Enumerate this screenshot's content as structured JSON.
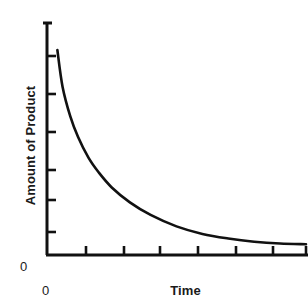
{
  "chart_data": {
    "type": "line",
    "title": "",
    "subtitle": "",
    "xlabel": "Time",
    "ylabel": "Amount of Product",
    "x_origin_label": "0",
    "y_origin_label": "0",
    "grid": false,
    "legend": null,
    "xlim": [
      0,
      10
    ],
    "ylim": [
      0,
      10
    ],
    "x_tick_labels": [],
    "y_tick_labels": [],
    "x_tick_count": 7,
    "y_tick_count": 6,
    "annotations": [],
    "series": [
      {
        "name": "Amount of Product",
        "color": "#111111",
        "x": [
          0.4,
          0.6,
          0.9,
          1.2,
          1.6,
          2.0,
          2.5,
          3.2,
          4.0,
          5.0,
          6.0,
          7.0,
          8.0,
          9.0,
          10.0
        ],
        "y": [
          8.95,
          7.35,
          6.05,
          5.15,
          4.25,
          3.6,
          2.95,
          2.3,
          1.75,
          1.25,
          0.92,
          0.72,
          0.58,
          0.5,
          0.47
        ]
      }
    ]
  },
  "colors": {
    "background": "#ffffff",
    "axis": "#111111",
    "curve": "#111111",
    "text": "#1a1a1a"
  }
}
